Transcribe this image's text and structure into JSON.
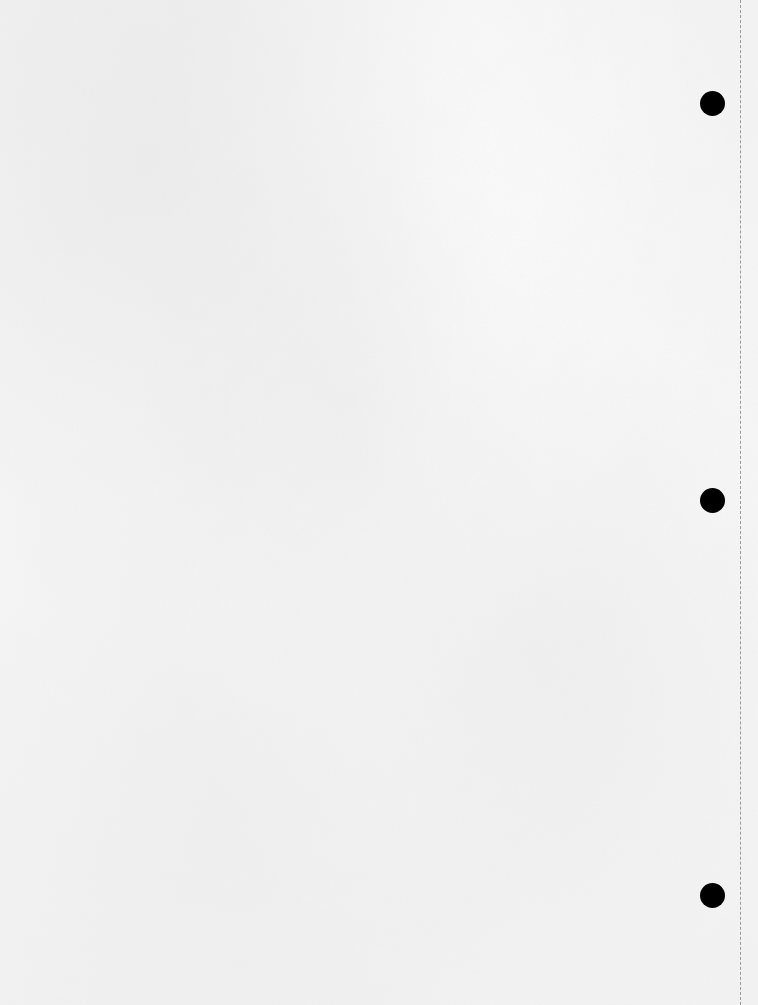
{
  "sheet": {
    "type": "blank-paper",
    "background_color": "#f6f6f6",
    "punch_holes": [
      {
        "cx": 712,
        "cy": 103
      },
      {
        "cx": 712,
        "cy": 500
      },
      {
        "cx": 712,
        "cy": 895
      }
    ],
    "hole_color": "#000000",
    "perforation": {
      "x": 740,
      "style": "dashed",
      "color": "#9a9a9a"
    }
  }
}
